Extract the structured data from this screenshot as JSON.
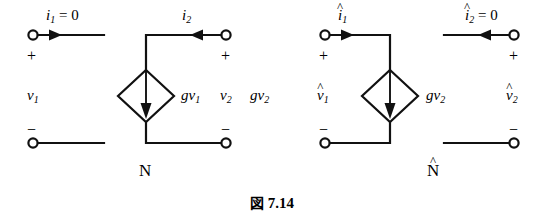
{
  "figure": {
    "caption_prefix": "図",
    "caption_number": "7.14",
    "networks": [
      {
        "name": "N",
        "hat": false
      },
      {
        "name": "N",
        "hat": true
      }
    ]
  },
  "left_circuit": {
    "name": "N",
    "top_left_current": {
      "symbol": "i",
      "subscript": "1",
      "equals": "= 0",
      "hat": false,
      "arrow_direction": "right"
    },
    "top_right_current": {
      "symbol": "i",
      "subscript": "2",
      "equals": "",
      "hat": false,
      "arrow_direction": "left"
    },
    "left_port": {
      "plus": "+",
      "minus": "−",
      "voltage_symbol": "v",
      "voltage_subscript": "1",
      "hat": false
    },
    "right_port": {
      "plus": "+",
      "minus": "−",
      "voltage_symbol": "v",
      "voltage_subscript": "2",
      "hat": false
    },
    "source": {
      "type": "dependent-current-source",
      "shape": "diamond",
      "arrow_direction": "down",
      "label_gain": "g",
      "label_symbol": "v",
      "label_subscript": "1",
      "hat": false
    },
    "extra_label": {
      "symbol": "g",
      "var_symbol": "v",
      "var_subscript": "2"
    }
  },
  "right_circuit": {
    "name": "N",
    "name_hat": true,
    "top_left_current": {
      "symbol": "i",
      "subscript": "1",
      "equals": "",
      "hat": true,
      "arrow_direction": "right"
    },
    "top_right_current": {
      "symbol": "i",
      "subscript": "2",
      "equals": "= 0",
      "hat": true,
      "arrow_direction": "left"
    },
    "left_port": {
      "plus": "+",
      "minus": "−",
      "voltage_symbol": "v",
      "voltage_subscript": "1",
      "hat": true
    },
    "right_port": {
      "plus": "+",
      "minus": "−",
      "voltage_symbol": "v",
      "voltage_subscript": "2",
      "hat": true
    },
    "source": {
      "type": "dependent-current-source",
      "shape": "diamond",
      "arrow_direction": "down",
      "label_gain": "g",
      "label_symbol": "v",
      "label_subscript": "2",
      "hat": false
    }
  },
  "style": {
    "ink": "#000000",
    "paper": "#ffffff"
  }
}
